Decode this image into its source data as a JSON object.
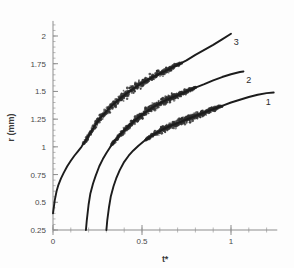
{
  "figure": {
    "background_color": "#fdfdfd",
    "axis_color": "#8d8d8d",
    "curve_color": "#1c1c1c",
    "scatter_color": "#2e2e2e"
  },
  "chart_data": {
    "type": "scatter",
    "title": "",
    "subtitle": "",
    "xlabel": "t*",
    "ylabel": "r (mm)",
    "xlim": [
      0,
      1.26
    ],
    "ylim": [
      0.25,
      2.1
    ],
    "grid": false,
    "legend_position": "inline-right-annotations",
    "x_ticks": [
      0,
      0.5,
      1
    ],
    "x_tick_labels": [
      "0",
      "0.5",
      "1"
    ],
    "x_minor_tick_step": 0.1,
    "y_ticks": [
      0.25,
      0.5,
      0.75,
      1,
      1.25,
      1.5,
      1.75,
      2
    ],
    "y_tick_labels": [
      "0.25",
      "0.5",
      "0.75",
      "1",
      "1.25",
      "1.5",
      "1.75",
      "2"
    ],
    "y_minor_tick_step": 0.05,
    "annotations": [
      {
        "text": "3",
        "x": 1.03,
        "y": 1.92
      },
      {
        "text": "2",
        "x": 1.1,
        "y": 1.58
      },
      {
        "text": "1",
        "x": 1.21,
        "y": 1.38
      }
    ],
    "series": [
      {
        "name": "3",
        "label": "3",
        "color": "#1c1c1c",
        "noise_band": 0.055,
        "noise_start_x": 0.17,
        "noise_end_x": 0.72,
        "x": [
          0.0,
          0.01,
          0.02,
          0.03,
          0.045,
          0.06,
          0.08,
          0.1,
          0.12,
          0.14,
          0.16,
          0.18,
          0.2,
          0.23,
          0.26,
          0.3,
          0.34,
          0.38,
          0.42,
          0.46,
          0.5,
          0.55,
          0.6,
          0.65,
          0.7,
          0.75,
          0.8,
          0.85,
          0.9,
          0.95,
          1.0
        ],
        "y": [
          0.4,
          0.52,
          0.6,
          0.655,
          0.715,
          0.765,
          0.825,
          0.875,
          0.92,
          0.96,
          1.0,
          1.05,
          1.1,
          1.18,
          1.25,
          1.32,
          1.385,
          1.44,
          1.49,
          1.535,
          1.575,
          1.62,
          1.66,
          1.7,
          1.74,
          1.78,
          1.83,
          1.875,
          1.92,
          1.97,
          2.02
        ]
      },
      {
        "name": "2",
        "label": "2",
        "color": "#1c1c1c",
        "noise_band": 0.05,
        "noise_start_x": 0.33,
        "noise_end_x": 0.8,
        "x": [
          0.185,
          0.19,
          0.2,
          0.21,
          0.225,
          0.24,
          0.26,
          0.28,
          0.3,
          0.32,
          0.34,
          0.37,
          0.4,
          0.43,
          0.46,
          0.5,
          0.54,
          0.58,
          0.62,
          0.66,
          0.7,
          0.75,
          0.8,
          0.85,
          0.9,
          0.95,
          1.0,
          1.05,
          1.07
        ],
        "y": [
          0.25,
          0.34,
          0.48,
          0.58,
          0.67,
          0.74,
          0.825,
          0.89,
          0.945,
          0.995,
          1.04,
          1.1,
          1.15,
          1.195,
          1.24,
          1.29,
          1.335,
          1.375,
          1.41,
          1.44,
          1.465,
          1.5,
          1.535,
          1.565,
          1.6,
          1.63,
          1.655,
          1.675,
          1.68
        ]
      },
      {
        "name": "1",
        "label": "1",
        "color": "#1c1c1c",
        "noise_band": 0.045,
        "noise_start_x": 0.52,
        "noise_end_x": 0.95,
        "x": [
          0.3,
          0.305,
          0.315,
          0.325,
          0.34,
          0.355,
          0.375,
          0.4,
          0.425,
          0.45,
          0.48,
          0.51,
          0.54,
          0.58,
          0.62,
          0.66,
          0.7,
          0.74,
          0.78,
          0.82,
          0.86,
          0.9,
          0.95,
          1.0,
          1.05,
          1.1,
          1.15,
          1.2,
          1.24
        ],
        "y": [
          0.25,
          0.34,
          0.46,
          0.555,
          0.645,
          0.715,
          0.79,
          0.865,
          0.92,
          0.965,
          1.01,
          1.05,
          1.085,
          1.125,
          1.16,
          1.19,
          1.215,
          1.24,
          1.265,
          1.29,
          1.315,
          1.34,
          1.37,
          1.4,
          1.425,
          1.45,
          1.47,
          1.485,
          1.49
        ]
      }
    ]
  }
}
